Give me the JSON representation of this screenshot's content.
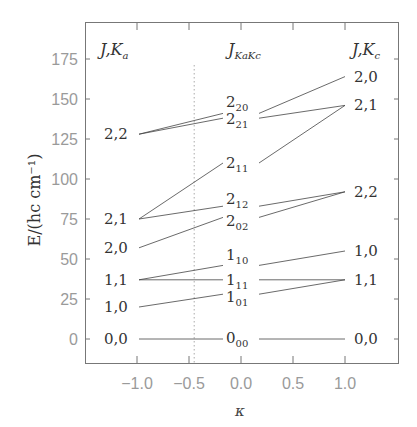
{
  "page_header": {
    "running_title": "",
    "page_number": ""
  },
  "chart_data": {
    "type": "line",
    "title": "",
    "xlabel": "κ",
    "ylabel": "E/(hc cm⁻¹)",
    "xlim": [
      -1.4,
      1.4
    ],
    "ylim": [
      -12,
      196
    ],
    "xticks": [
      -1.0,
      -0.5,
      0.0,
      0.5,
      1.0
    ],
    "xtick_labels": [
      "−1.0",
      "−0.5",
      "0.0",
      "0.5",
      "1.0"
    ],
    "yticks": [
      0,
      25,
      50,
      75,
      100,
      125,
      150,
      175
    ],
    "ytick_labels": [
      "0",
      "25",
      "50",
      "75",
      "100",
      "125",
      "150",
      "175"
    ],
    "grid": false,
    "vertical_reference_line": {
      "x": -0.45,
      "style": "dotted"
    },
    "column_headers": {
      "left": {
        "main": "J,K",
        "sub": "a"
      },
      "center": {
        "main": "J",
        "sub": "KaKc"
      },
      "right": {
        "main": "J,K",
        "sub": "c"
      }
    },
    "left_levels": [
      {
        "label": "0,0",
        "E": 0
      },
      {
        "label": "1,0",
        "E": 20
      },
      {
        "label": "1,1",
        "E": 37
      },
      {
        "label": "2,0",
        "E": 57
      },
      {
        "label": "2,1",
        "E": 75
      },
      {
        "label": "2,2",
        "E": 128
      }
    ],
    "center_levels": [
      {
        "main": "0",
        "sub": "00",
        "E": 0
      },
      {
        "main": "1",
        "sub": "01",
        "E": 28
      },
      {
        "main": "1",
        "sub": "11",
        "E": 37
      },
      {
        "main": "1",
        "sub": "10",
        "E": 46
      },
      {
        "main": "2",
        "sub": "02",
        "E": 76
      },
      {
        "main": "2",
        "sub": "12",
        "E": 83
      },
      {
        "main": "2",
        "sub": "11",
        "E": 110
      },
      {
        "main": "2",
        "sub": "21",
        "E": 138
      },
      {
        "main": "2",
        "sub": "20",
        "E": 141
      }
    ],
    "right_levels": [
      {
        "label": "0,0",
        "E": 0
      },
      {
        "label": "1,1",
        "E": 37
      },
      {
        "label": "1,0",
        "E": 55
      },
      {
        "label": "2,2",
        "E": 92
      },
      {
        "label": "2,1",
        "E": 146
      },
      {
        "label": "2,0",
        "E": 164
      }
    ],
    "series": [
      {
        "name": "0_00",
        "x": [
          -1,
          0,
          1
        ],
        "values": [
          0,
          0,
          0
        ],
        "from": "0,0",
        "to": "0,0"
      },
      {
        "name": "1_01",
        "x": [
          -1,
          0,
          1
        ],
        "values": [
          20,
          28,
          37
        ],
        "from": "1,0",
        "to": "1,1"
      },
      {
        "name": "1_11",
        "x": [
          -1,
          0,
          1
        ],
        "values": [
          37,
          37,
          37
        ],
        "from": "1,1",
        "to": "1,1"
      },
      {
        "name": "1_10",
        "x": [
          -1,
          0,
          1
        ],
        "values": [
          37,
          46,
          55
        ],
        "from": "1,1",
        "to": "1,0"
      },
      {
        "name": "2_02",
        "x": [
          -1,
          0,
          1
        ],
        "values": [
          57,
          76,
          92
        ],
        "from": "2,0",
        "to": "2,2"
      },
      {
        "name": "2_12",
        "x": [
          -1,
          0,
          1
        ],
        "values": [
          75,
          83,
          92
        ],
        "from": "2,1",
        "to": "2,2"
      },
      {
        "name": "2_11",
        "x": [
          -1,
          0,
          1
        ],
        "values": [
          75,
          110,
          146
        ],
        "from": "2,1",
        "to": "2,1"
      },
      {
        "name": "2_21",
        "x": [
          -1,
          0,
          1
        ],
        "values": [
          128,
          138,
          146
        ],
        "from": "2,2",
        "to": "2,1"
      },
      {
        "name": "2_20",
        "x": [
          -1,
          0,
          1
        ],
        "values": [
          128,
          141,
          164
        ],
        "from": "2,2",
        "to": "2,0"
      }
    ]
  }
}
